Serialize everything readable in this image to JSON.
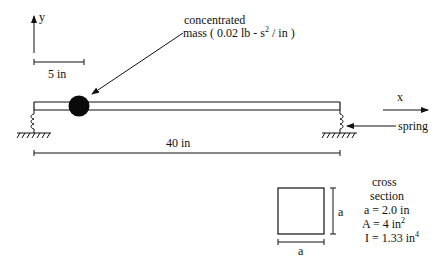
{
  "diagram": {
    "type": "beam-with-springs-and-concentrated-mass",
    "axes": {
      "y_label": "y",
      "x_label": "x"
    },
    "scale_bar": {
      "label": "5 in"
    },
    "mass_callout": {
      "line1": "concentrated",
      "line2_prefix": "mass ( 0.02 lb - s",
      "line2_sup": "2",
      "line2_suffix": " / in )"
    },
    "span": {
      "label": "40 in"
    },
    "spring_label": "spring",
    "cross_section": {
      "title_line1": "cross",
      "title_line2": "section",
      "side_label_vertical": "a",
      "side_label_horizontal": "a",
      "a_value": "a = 2.0 in",
      "area_prefix": "A = 4 in",
      "area_sup": "2",
      "inertia_prefix": "I = 1.33 in",
      "inertia_sup": "4"
    },
    "colors": {
      "ink": "#111111",
      "background": "#ffffff"
    }
  }
}
